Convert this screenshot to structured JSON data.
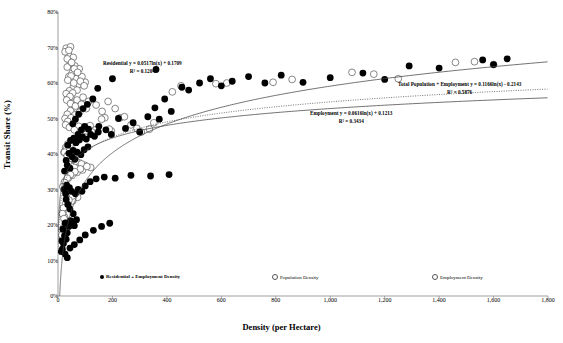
{
  "axes": {
    "x_title": "Density (per Hectare)",
    "y_title": "Transit Share (%)",
    "x_ticks": [
      "0",
      "200",
      "400",
      "600",
      "800",
      "1,000",
      "1,200",
      "1,400",
      "1,600",
      "1,800"
    ],
    "y_ticks": [
      "80%",
      "70%",
      "60%",
      "50%",
      "40%",
      "30%",
      "20%",
      "10%",
      "0%"
    ]
  },
  "annotations": {
    "residential": {
      "line1": "Residential y = 0.0517ln(x) + 0.1709",
      "line2": "R² = 0.1204"
    },
    "total": {
      "line1": "Total Population + Employment y = 0.1166ln(x) - 0.2143",
      "line2": "R² = 0.5876"
    },
    "employment": {
      "line1": "Employment y = 0.0616ln(x) + 0.1213",
      "line2": "R² = 0.3434"
    }
  },
  "legend": {
    "items": [
      {
        "label": "Residential + Employment Density",
        "marker": "filled"
      },
      {
        "label": "Population Density",
        "marker": "open"
      },
      {
        "label": "Employment Density",
        "marker": "open"
      }
    ]
  },
  "colors": {
    "marker_fill": "#000000",
    "marker_open": "#555555",
    "trend": "#444444",
    "axis": "#777777"
  },
  "chart_data": {
    "type": "scatter",
    "title": "",
    "xlabel": "Density (per Hectare)",
    "ylabel": "Transit Share (%)",
    "xlim": [
      0,
      1800
    ],
    "ylim": [
      0,
      0.8
    ],
    "grid": false,
    "legend_position": "bottom",
    "trendlines": [
      {
        "name": "Residential",
        "form": "y = 0.0517ln(x) + 0.1709",
        "a": 0.0517,
        "b": 0.1709,
        "r2": 0.1204,
        "style": "solid"
      },
      {
        "name": "Total Population + Employment",
        "form": "y = 0.1166ln(x) - 0.2143",
        "a": 0.1166,
        "b": -0.2143,
        "r2": 0.5876,
        "style": "solid"
      },
      {
        "name": "Employment",
        "form": "y = 0.0616ln(x) + 0.1213",
        "a": 0.0616,
        "b": 0.1213,
        "r2": 0.3434,
        "style": "dotted"
      }
    ],
    "series": [
      {
        "name": "Residential + Employment Density",
        "marker": "filled",
        "points": [
          [
            12,
            0.125
          ],
          [
            16,
            0.132
          ],
          [
            14,
            0.155
          ],
          [
            20,
            0.148
          ],
          [
            24,
            0.17
          ],
          [
            18,
            0.188
          ],
          [
            30,
            0.16
          ],
          [
            34,
            0.178
          ],
          [
            26,
            0.205
          ],
          [
            40,
            0.196
          ],
          [
            46,
            0.212
          ],
          [
            52,
            0.205
          ],
          [
            60,
            0.198
          ],
          [
            68,
            0.215
          ],
          [
            56,
            0.232
          ],
          [
            44,
            0.245
          ],
          [
            36,
            0.258
          ],
          [
            30,
            0.272
          ],
          [
            28,
            0.288
          ],
          [
            22,
            0.3
          ],
          [
            32,
            0.312
          ],
          [
            42,
            0.305
          ],
          [
            50,
            0.295
          ],
          [
            64,
            0.288
          ],
          [
            74,
            0.3
          ],
          [
            88,
            0.295
          ],
          [
            100,
            0.31
          ],
          [
            118,
            0.322
          ],
          [
            140,
            0.33
          ],
          [
            170,
            0.335
          ],
          [
            210,
            0.332
          ],
          [
            268,
            0.34
          ],
          [
            340,
            0.338
          ],
          [
            408,
            0.342
          ],
          [
            24,
            0.352
          ],
          [
            34,
            0.368
          ],
          [
            44,
            0.36
          ],
          [
            30,
            0.382
          ],
          [
            52,
            0.392
          ],
          [
            62,
            0.385
          ],
          [
            40,
            0.402
          ],
          [
            56,
            0.41
          ],
          [
            70,
            0.405
          ],
          [
            84,
            0.398
          ],
          [
            96,
            0.412
          ],
          [
            110,
            0.42
          ],
          [
            66,
            0.432
          ],
          [
            78,
            0.44
          ],
          [
            90,
            0.448
          ],
          [
            104,
            0.442
          ],
          [
            120,
            0.455
          ],
          [
            134,
            0.45
          ],
          [
            148,
            0.462
          ],
          [
            112,
            0.47
          ],
          [
            98,
            0.478
          ],
          [
            86,
            0.468
          ],
          [
            74,
            0.455
          ],
          [
            58,
            0.445
          ],
          [
            46,
            0.438
          ],
          [
            36,
            0.425
          ],
          [
            150,
            0.478
          ],
          [
            176,
            0.468
          ],
          [
            196,
            0.455
          ],
          [
            222,
            0.5
          ],
          [
            248,
            0.472
          ],
          [
            276,
            0.488
          ],
          [
            300,
            0.462
          ],
          [
            330,
            0.505
          ],
          [
            356,
            0.53
          ],
          [
            372,
            0.498
          ],
          [
            392,
            0.555
          ],
          [
            416,
            0.52
          ],
          [
            455,
            0.588
          ],
          [
            520,
            0.6
          ],
          [
            560,
            0.612
          ],
          [
            600,
            0.592
          ],
          [
            640,
            0.605
          ],
          [
            700,
            0.618
          ],
          [
            760,
            0.6
          ],
          [
            820,
            0.622
          ],
          [
            900,
            0.602
          ],
          [
            1000,
            0.615
          ],
          [
            1120,
            0.628
          ],
          [
            1200,
            0.61
          ],
          [
            1290,
            0.648
          ],
          [
            1400,
            0.642
          ],
          [
            1560,
            0.665
          ],
          [
            1600,
            0.652
          ],
          [
            1650,
            0.668
          ],
          [
            200,
            0.612
          ],
          [
            360,
            0.638
          ],
          [
            480,
            0.58
          ],
          [
            146,
            0.585
          ],
          [
            128,
            0.555
          ],
          [
            108,
            0.54
          ],
          [
            92,
            0.528
          ],
          [
            76,
            0.512
          ],
          [
            64,
            0.498
          ],
          [
            54,
            0.485
          ],
          [
            26,
            0.118
          ],
          [
            34,
            0.108
          ],
          [
            44,
            0.135
          ],
          [
            60,
            0.145
          ],
          [
            80,
            0.158
          ],
          [
            100,
            0.172
          ],
          [
            130,
            0.185
          ],
          [
            160,
            0.196
          ],
          [
            190,
            0.205
          ]
        ]
      },
      {
        "name": "Population Density",
        "marker": "open",
        "points": [
          [
            30,
            0.698
          ],
          [
            46,
            0.702
          ],
          [
            38,
            0.68
          ],
          [
            56,
            0.672
          ],
          [
            44,
            0.66
          ],
          [
            34,
            0.645
          ],
          [
            62,
            0.648
          ],
          [
            78,
            0.64
          ],
          [
            52,
            0.628
          ],
          [
            40,
            0.618
          ],
          [
            66,
            0.612
          ],
          [
            88,
            0.618
          ],
          [
            100,
            0.602
          ],
          [
            74,
            0.595
          ],
          [
            56,
            0.588
          ],
          [
            42,
            0.578
          ],
          [
            30,
            0.57
          ],
          [
            48,
            0.56
          ],
          [
            70,
            0.552
          ],
          [
            92,
            0.56
          ],
          [
            112,
            0.548
          ],
          [
            86,
            0.538
          ],
          [
            64,
            0.53
          ],
          [
            46,
            0.522
          ],
          [
            34,
            0.512
          ],
          [
            26,
            0.5
          ],
          [
            40,
            0.492
          ],
          [
            58,
            0.485
          ],
          [
            76,
            0.478
          ],
          [
            96,
            0.472
          ],
          [
            118,
            0.48
          ],
          [
            138,
            0.468
          ],
          [
            108,
            0.458
          ],
          [
            88,
            0.45
          ],
          [
            68,
            0.442
          ],
          [
            50,
            0.435
          ],
          [
            36,
            0.428
          ],
          [
            28,
            0.418
          ],
          [
            22,
            0.405
          ],
          [
            32,
            0.398
          ],
          [
            44,
            0.39
          ],
          [
            60,
            0.382
          ],
          [
            78,
            0.375
          ],
          [
            98,
            0.368
          ],
          [
            120,
            0.362
          ],
          [
            90,
            0.355
          ],
          [
            70,
            0.348
          ],
          [
            52,
            0.34
          ],
          [
            38,
            0.332
          ],
          [
            26,
            0.322
          ],
          [
            20,
            0.31
          ],
          [
            30,
            0.3
          ],
          [
            42,
            0.292
          ],
          [
            56,
            0.285
          ],
          [
            72,
            0.278
          ],
          [
            54,
            0.268
          ],
          [
            38,
            0.258
          ],
          [
            26,
            0.248
          ],
          [
            18,
            0.235
          ],
          [
            24,
            0.222
          ],
          [
            32,
            0.21
          ],
          [
            44,
            0.2
          ],
          [
            30,
            0.19
          ],
          [
            20,
            0.178
          ],
          [
            16,
            0.165
          ],
          [
            172,
            0.502
          ],
          [
            196,
            0.465
          ],
          [
            228,
            0.502
          ],
          [
            268,
            0.482
          ],
          [
            306,
            0.462
          ],
          [
            352,
            0.488
          ],
          [
            452,
            0.592
          ],
          [
            620,
            0.6
          ],
          [
            790,
            0.602
          ],
          [
            1080,
            0.63
          ],
          [
            1250,
            0.612
          ],
          [
            1530,
            0.66
          ],
          [
            1600,
            0.652
          ],
          [
            140,
            0.538
          ],
          [
            162,
            0.52
          ],
          [
            184,
            0.548
          ],
          [
            210,
            0.528
          ]
        ]
      },
      {
        "name": "Employment Density",
        "marker": "open",
        "points": [
          [
            26,
            0.688
          ],
          [
            40,
            0.692
          ],
          [
            34,
            0.668
          ],
          [
            50,
            0.658
          ],
          [
            60,
            0.64
          ],
          [
            72,
            0.63
          ],
          [
            48,
            0.62
          ],
          [
            36,
            0.608
          ],
          [
            58,
            0.6
          ],
          [
            82,
            0.605
          ],
          [
            96,
            0.592
          ],
          [
            70,
            0.58
          ],
          [
            54,
            0.572
          ],
          [
            44,
            0.562
          ],
          [
            32,
            0.552
          ],
          [
            46,
            0.542
          ],
          [
            64,
            0.535
          ],
          [
            86,
            0.54
          ],
          [
            104,
            0.528
          ],
          [
            80,
            0.518
          ],
          [
            62,
            0.51
          ],
          [
            48,
            0.502
          ],
          [
            36,
            0.492
          ],
          [
            28,
            0.482
          ],
          [
            42,
            0.475
          ],
          [
            60,
            0.468
          ],
          [
            80,
            0.46
          ],
          [
            102,
            0.455
          ],
          [
            124,
            0.462
          ],
          [
            98,
            0.448
          ],
          [
            78,
            0.44
          ],
          [
            60,
            0.432
          ],
          [
            44,
            0.425
          ],
          [
            32,
            0.415
          ],
          [
            24,
            0.405
          ],
          [
            34,
            0.395
          ],
          [
            48,
            0.388
          ],
          [
            66,
            0.38
          ],
          [
            86,
            0.372
          ],
          [
            106,
            0.365
          ],
          [
            82,
            0.358
          ],
          [
            62,
            0.35
          ],
          [
            46,
            0.342
          ],
          [
            34,
            0.332
          ],
          [
            24,
            0.32
          ],
          [
            18,
            0.308
          ],
          [
            28,
            0.298
          ],
          [
            40,
            0.29
          ],
          [
            54,
            0.282
          ],
          [
            40,
            0.27
          ],
          [
            28,
            0.26
          ],
          [
            20,
            0.248
          ],
          [
            16,
            0.232
          ],
          [
            22,
            0.218
          ],
          [
            30,
            0.206
          ],
          [
            20,
            0.192
          ],
          [
            14,
            0.172
          ],
          [
            160,
            0.498
          ],
          [
            188,
            0.47
          ],
          [
            244,
            0.505
          ],
          [
            290,
            0.472
          ],
          [
            336,
            0.47
          ],
          [
            420,
            0.575
          ],
          [
            580,
            0.598
          ],
          [
            860,
            0.61
          ],
          [
            1160,
            0.625
          ],
          [
            1460,
            0.658
          ]
        ]
      }
    ]
  }
}
